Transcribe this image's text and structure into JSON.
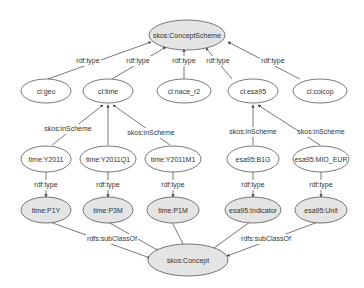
{
  "colors": {
    "filled_node": "#e4e4e4",
    "empty_node": "#ffffff",
    "stroke": "#555555",
    "text": "#333333"
  },
  "nodes": {
    "concept_scheme": "skos:ConceptScheme",
    "cl_geo": "cl:geo",
    "cl_time": "cl:time",
    "cl_nace_r2": "cl:nace_r2",
    "cl_esa95": "cl:esa95",
    "cl_coicop": "cl:coicop",
    "time_y2011": "time:Y2011",
    "time_y2011q1": "time:Y2011Q1",
    "time_y2011m1": "time:Y2011M1",
    "esa95_b1g": "esa95:B1G",
    "esa95_mio_eur": "esa95:MIO_EUR",
    "time_p1y": "time:P1Y",
    "time_p3m": "time:P3M",
    "time_p1m": "time:P1M",
    "esa95_indicator": "esa95:Indicator",
    "esa95_unit": "esa95:Unit",
    "skos_concept": "skos:Concept"
  },
  "edges": {
    "geo_type": "rdf:type",
    "time_type": "rdf:type",
    "nace_type": "rdf:type",
    "esa95_type": "rdf:type",
    "coicop_type": "rdf:type",
    "y2011_inscheme": "skos:inScheme",
    "y2011m1_inscheme": "skos:inScheme",
    "b1g_inscheme": "skos:inScheme",
    "mio_inscheme": "skos:inScheme",
    "y2011_type": "rdf:type",
    "y2011q1_type": "rdf:type",
    "y2011m1_type": "rdf:type",
    "b1g_type": "rdf:type",
    "mio_type": "rdf:type",
    "left_subclass": "rdfs:subClassOf",
    "right_subclass": "rdfs:subClassOf"
  }
}
